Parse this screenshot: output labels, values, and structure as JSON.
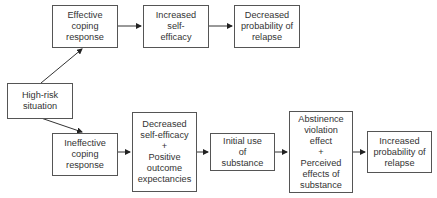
{
  "diagram": {
    "type": "flowchart",
    "nodes": {
      "high_risk": "High-risk\nsituation",
      "effective_coping": "Effective\ncoping\nresponse",
      "increased_self_efficacy": "Increased\nself-\nefficacy",
      "decreased_relapse": "Decreased\nprobability of\nrelapse",
      "ineffective_coping": "Ineffective\ncoping\nresponse",
      "decreased_self_efficacy": "Decreased\nself-efficacy\n+\nPositive\noutcome\nexpectancies",
      "initial_use": "Initial use\nof\nsubstance",
      "abstinence_violation": "Abstinence\nviolation\neffect\n+\nPerceived\neffects of\nsubstance",
      "increased_relapse": "Increased\nprobability of\nrelapse"
    },
    "edges": [
      [
        "high_risk",
        "effective_coping"
      ],
      [
        "effective_coping",
        "increased_self_efficacy"
      ],
      [
        "increased_self_efficacy",
        "decreased_relapse"
      ],
      [
        "high_risk",
        "ineffective_coping"
      ],
      [
        "ineffective_coping",
        "decreased_self_efficacy"
      ],
      [
        "decreased_self_efficacy",
        "initial_use"
      ],
      [
        "initial_use",
        "abstinence_violation"
      ],
      [
        "abstinence_violation",
        "increased_relapse"
      ]
    ]
  }
}
